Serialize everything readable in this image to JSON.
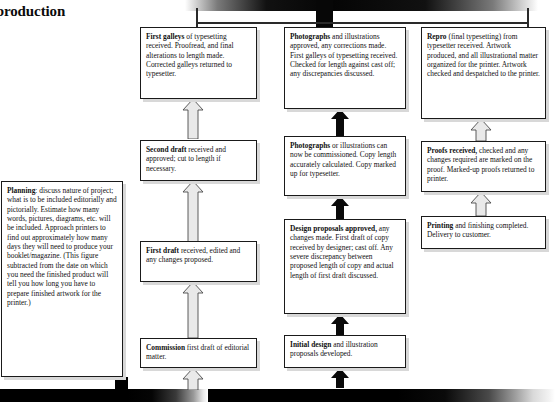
{
  "title": {
    "line1": "cal production",
    "line2": "ule",
    "full": "cal production ule"
  },
  "diagram": {
    "type": "flowchart",
    "columns": [
      "editorial",
      "design",
      "production"
    ],
    "boxes": [
      {
        "id": "first-galleys",
        "column": "editorial",
        "lead": "First galleys",
        "text": " of typesetting received. Proofread, and final alterations to length made. Corrected galleys returned to typesetter."
      },
      {
        "id": "second-draft",
        "column": "editorial",
        "lead": "Second draft",
        "text": " received and approved; cut to length if necessary."
      },
      {
        "id": "first-draft",
        "column": "editorial",
        "lead": "First draft",
        "text": " received, edited and any changes proposed."
      },
      {
        "id": "commission",
        "column": "editorial",
        "lead": "Commission",
        "text": " first draft of editorial matter."
      },
      {
        "id": "photographs-approved",
        "column": "design",
        "lead": "Photographs",
        "text": " and illustrations approved, any corrections made. First galleys of typesetting received. Checked for length against cast off; any discrepancies discussed."
      },
      {
        "id": "photographs-commissioned",
        "column": "design",
        "lead": "Photographs",
        "text": " or illustrations can now be commissioned. Copy length accurately calculated. Copy marked up for typesetter."
      },
      {
        "id": "design-proposals",
        "column": "design",
        "lead": "Design proposals approved,",
        "text": " any changes made. First draft of copy received by designer; cast off. Any severe discrepancy between proposed length of copy and actual length of first draft discussed."
      },
      {
        "id": "initial-design",
        "column": "design",
        "lead": "Initial design",
        "text": " and illustration proposals developed."
      },
      {
        "id": "repro",
        "column": "production",
        "lead": "Repro",
        "text": " (final typesetting) from typesetter received. Artwork produced, and all illustrational matter organized for the printer. Artwork checked and despatched to the printer."
      },
      {
        "id": "proofs-received",
        "column": "production",
        "lead": "Proofs received,",
        "text": " checked and any changes required are marked on the proof. Marked-up proofs returned to printer."
      },
      {
        "id": "printing",
        "column": "production",
        "lead": "Printing",
        "text": " and finishing completed. Delivery to customer."
      },
      {
        "id": "planning",
        "column": "left",
        "lead": "Planning",
        "text": ": discuss nature of project; what is to be included editorially and pictorially. Estimate how many words, pictures, diagrams, etc. will be included. Approach printers to find out approximately how many days they will need to produce your booklet/magazine. (This figure subtracted from the date on which you need the finished product will tell you how long you have to prepare finished artwork for the printer.)"
      }
    ],
    "connectors": {
      "vertical_arrow_count": 9,
      "hexagon_link_count": 3,
      "top_rail": true,
      "bottom_rail": true
    }
  },
  "colors": {
    "box_border": "#1a1a1a",
    "box_fill": "#ffffff",
    "shadow": "#d8d8d8",
    "rail_dark": "#070707",
    "text": "#111111"
  }
}
